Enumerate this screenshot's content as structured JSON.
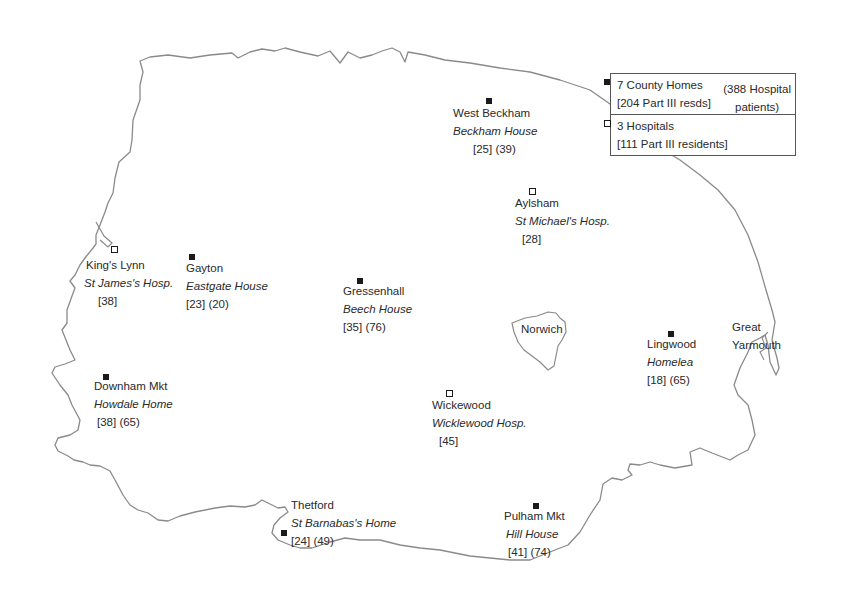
{
  "legend": {
    "county_homes": {
      "marker": "filled-square",
      "line1": "7 County Homes",
      "line2": "[204 Part III resds]",
      "extra_line1": "(388 Hospital",
      "extra_line2": "patients)"
    },
    "hospitals": {
      "marker": "hollow-square",
      "line1": "3 Hospitals",
      "line2": "[111 Part III residents]"
    }
  },
  "towns": {
    "norwich": "Norwich",
    "great_yarmouth_1": "Great",
    "great_yarmouth_2": "Yarmouth"
  },
  "sites": [
    {
      "type": "county-home",
      "place": "West Beckham",
      "institution": "Beckham House",
      "figures": "[25] (39)"
    },
    {
      "type": "hospital",
      "place": "Aylsham",
      "institution": "St Michael's Hosp.",
      "figures": "[28]"
    },
    {
      "type": "hospital",
      "place": "King's Lynn",
      "institution": "St James's Hosp.",
      "figures": "[38]"
    },
    {
      "type": "county-home",
      "place": "Gayton",
      "institution": "Eastgate House",
      "figures": "[23] (20)"
    },
    {
      "type": "county-home",
      "place": "Gressenhall",
      "institution": "Beech House",
      "figures": "[35] (76)"
    },
    {
      "type": "county-home",
      "place": "Lingwood",
      "institution": "Homelea",
      "figures": "[18] (65)"
    },
    {
      "type": "county-home",
      "place": "Downham Mkt",
      "institution": "Howdale Home",
      "figures": "[38] (65)"
    },
    {
      "type": "hospital",
      "place": "Wickewood",
      "institution": "Wicklewood Hosp.",
      "figures": "[45]"
    },
    {
      "type": "county-home",
      "place": "Thetford",
      "institution": "St Barnabas's Home",
      "figures": "[24] (49)"
    },
    {
      "type": "county-home",
      "place": "Pulham Mkt",
      "institution": "Hill House",
      "figures": "[41] (74)"
    }
  ],
  "colors": {
    "outline": "#8a8a8a",
    "text": "#2a2a2a",
    "marker": "#1a1a1a"
  }
}
